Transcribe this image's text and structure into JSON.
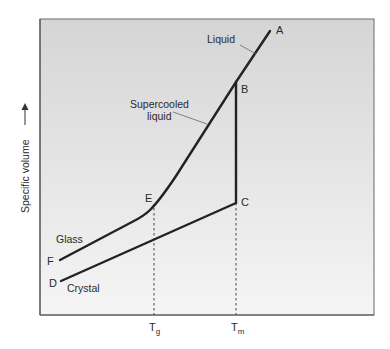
{
  "diagram": {
    "type": "specific-volume-vs-temperature",
    "y_axis_label": "Specific volume",
    "x_ticks": [
      {
        "main": "T",
        "sub": "g",
        "x": 154
      },
      {
        "main": "T",
        "sub": "m",
        "x": 236
      }
    ],
    "points": {
      "A": "A",
      "B": "B",
      "C": "C",
      "D": "D",
      "E": "E",
      "F": "F"
    },
    "region_labels": {
      "liquid": "Liquid",
      "supercooled_1": "Supercooled",
      "supercooled_2": "liquid",
      "glass": "Glass",
      "crystal": "Crystal"
    },
    "colors": {
      "plot_bg_top": "#d6d6d6",
      "plot_bg_bottom": "#f4f4f4",
      "curve": "#222222",
      "frame": "#6a6a6a"
    }
  }
}
